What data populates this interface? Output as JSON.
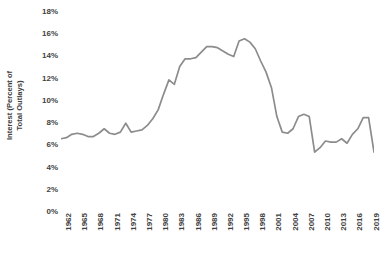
{
  "chart_data": {
    "type": "line",
    "title": "",
    "xlabel": "",
    "ylabel": "Interest (Percent of Total Outlays)",
    "ylabel_lines": [
      "Interest (Percent of",
      "Total Outlays)"
    ],
    "ylim": [
      0,
      18
    ],
    "ytick_values": [
      0,
      2,
      4,
      6,
      8,
      10,
      12,
      14,
      16,
      18
    ],
    "ytick_labels": [
      "0%",
      "2%",
      "4%",
      "6%",
      "8%",
      "10%",
      "12%",
      "14%",
      "16%",
      "18%"
    ],
    "xlim": [
      1962,
      2020
    ],
    "xtick_values": [
      1962,
      1965,
      1968,
      1971,
      1974,
      1977,
      1980,
      1983,
      1986,
      1989,
      1992,
      1995,
      1998,
      2001,
      2004,
      2007,
      2010,
      2013,
      2016,
      2019
    ],
    "xtick_labels": [
      "1962",
      "1965",
      "1968",
      "1971",
      "1974",
      "1977",
      "1980",
      "1983",
      "1986",
      "1989",
      "1992",
      "1995",
      "1998",
      "2001",
      "2004",
      "2007",
      "2010",
      "2013",
      "2016",
      "2019"
    ],
    "grid": false,
    "legend": false,
    "line_color": "#8c8c8c",
    "line_width": 1.7,
    "x": [
      1962,
      1963,
      1964,
      1965,
      1966,
      1967,
      1968,
      1969,
      1970,
      1971,
      1972,
      1973,
      1974,
      1975,
      1976,
      1977,
      1978,
      1979,
      1980,
      1981,
      1982,
      1983,
      1984,
      1985,
      1986,
      1987,
      1988,
      1989,
      1990,
      1991,
      1992,
      1993,
      1994,
      1995,
      1996,
      1997,
      1998,
      1999,
      2000,
      2001,
      2002,
      2003,
      2004,
      2005,
      2006,
      2007,
      2008,
      2009,
      2010,
      2011,
      2012,
      2013,
      2014,
      2015,
      2016,
      2017,
      2018,
      2019,
      2020
    ],
    "values": [
      6.5,
      6.6,
      6.9,
      7.0,
      6.9,
      6.7,
      6.7,
      7.0,
      7.4,
      7.0,
      6.9,
      7.1,
      7.9,
      7.1,
      7.2,
      7.3,
      7.7,
      8.3,
      9.1,
      10.5,
      11.8,
      11.4,
      13.0,
      13.7,
      13.7,
      13.8,
      14.3,
      14.8,
      14.8,
      14.7,
      14.4,
      14.1,
      13.9,
      15.3,
      15.5,
      15.2,
      14.6,
      13.5,
      12.5,
      11.1,
      8.5,
      7.1,
      7.0,
      7.4,
      8.5,
      8.7,
      8.5,
      5.3,
      5.7,
      6.3,
      6.2,
      6.2,
      6.5,
      6.1,
      6.9,
      7.4,
      8.4,
      8.4,
      5.3
    ],
    "x_pixel_left_year": 1962,
    "x_pixel_right_year": 2020
  },
  "chart_meta": {
    "background": "#ffffff",
    "tick_label_color": "#3f3f3f",
    "axis_title_color": "#404040"
  }
}
